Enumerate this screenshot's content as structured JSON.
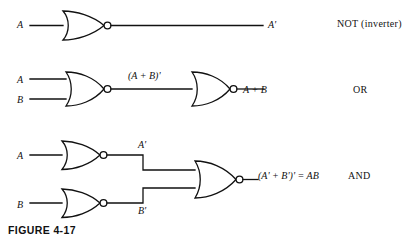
{
  "figure": {
    "caption": "FIGURE 4-17",
    "stroke_color": "#111111",
    "background_color": "#ffffff"
  },
  "rows": [
    {
      "id": "row-not",
      "category": "NOT (inverter)",
      "inputs": [
        "A"
      ],
      "output": "A'",
      "gates": [
        {
          "type": "nor-gate",
          "inputs": 1,
          "bubble": true
        }
      ],
      "intermediate_labels": []
    },
    {
      "id": "row-or",
      "category": "OR",
      "inputs": [
        "A",
        "B"
      ],
      "output": "A + B",
      "gates": [
        {
          "type": "nor-gate",
          "inputs": 2,
          "bubble": true
        },
        {
          "type": "nor-gate",
          "inputs": 1,
          "bubble": true
        }
      ],
      "intermediate_labels": [
        "(A + B)'"
      ]
    },
    {
      "id": "row-and",
      "category": "AND",
      "inputs": [
        "A",
        "B"
      ],
      "output": "(A' + B')' = AB",
      "gates": [
        {
          "type": "nor-gate",
          "inputs": 1,
          "bubble": true
        },
        {
          "type": "nor-gate",
          "inputs": 1,
          "bubble": true
        },
        {
          "type": "nor-gate",
          "inputs": 2,
          "bubble": true
        }
      ],
      "intermediate_labels": [
        "A'",
        "B'"
      ]
    }
  ]
}
